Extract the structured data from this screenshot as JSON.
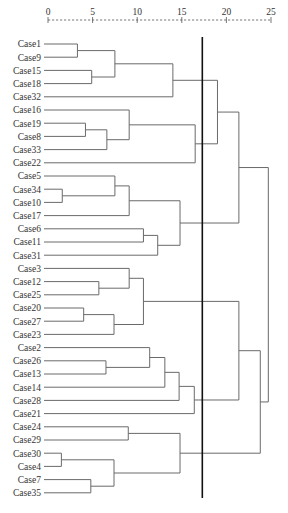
{
  "chart_data": {
    "type": "dendrogram",
    "title": "",
    "xlabel": "",
    "ylabel": "",
    "xlim": [
      0,
      25
    ],
    "ticks": [
      "0",
      "5",
      "10",
      "15",
      "20",
      "25"
    ],
    "tick_values": [
      0,
      5,
      10,
      15,
      20,
      25
    ],
    "leaves": [
      "Case1",
      "Case9",
      "Case15",
      "Case18",
      "Case32",
      "Case16",
      "Case19",
      "Case8",
      "Case33",
      "Case22",
      "Case5",
      "Case34",
      "Case10",
      "Case17",
      "Case6",
      "Case11",
      "Case31",
      "Case3",
      "Case12",
      "Case25",
      "Case20",
      "Case27",
      "Case23",
      "Case2",
      "Case26",
      "Case13",
      "Case14",
      "Case28",
      "Case21",
      "Case24",
      "Case29",
      "Case30",
      "Case4",
      "Case7",
      "Case35"
    ],
    "merges": [
      {
        "id": "m1",
        "left": "Case1",
        "right": "Case9",
        "height": 3.3
      },
      {
        "id": "m2",
        "left": "Case15",
        "right": "Case18",
        "height": 4.9
      },
      {
        "id": "m3",
        "left": "m1",
        "right": "m2",
        "height": 7.5
      },
      {
        "id": "m4",
        "left": "m3",
        "right": "Case32",
        "height": 14.0
      },
      {
        "id": "m5",
        "left": "Case19",
        "right": "Case8",
        "height": 4.2
      },
      {
        "id": "m6",
        "left": "m5",
        "right": "Case33",
        "height": 6.6
      },
      {
        "id": "m7",
        "left": "Case16",
        "right": "m6",
        "height": 9.1
      },
      {
        "id": "m8",
        "left": "m7",
        "right": "Case22",
        "height": 16.5
      },
      {
        "id": "m9",
        "left": "m4",
        "right": "m8",
        "height": 19.0
      },
      {
        "id": "m10",
        "left": "Case34",
        "right": "Case10",
        "height": 1.6
      },
      {
        "id": "m11",
        "left": "Case5",
        "right": "m10",
        "height": 7.5
      },
      {
        "id": "m12",
        "left": "m11",
        "right": "Case17",
        "height": 9.1
      },
      {
        "id": "m13",
        "left": "Case6",
        "right": "Case11",
        "height": 10.7
      },
      {
        "id": "m14",
        "left": "m13",
        "right": "Case31",
        "height": 12.3
      },
      {
        "id": "m15",
        "left": "m12",
        "right": "m14",
        "height": 14.8
      },
      {
        "id": "m16",
        "left": "m9",
        "right": "m15",
        "height": 21.4
      },
      {
        "id": "m17",
        "left": "Case12",
        "right": "Case25",
        "height": 5.7
      },
      {
        "id": "m18",
        "left": "Case3",
        "right": "m17",
        "height": 9.1
      },
      {
        "id": "m19",
        "left": "Case20",
        "right": "Case27",
        "height": 4.0
      },
      {
        "id": "m20",
        "left": "m19",
        "right": "Case23",
        "height": 7.4
      },
      {
        "id": "m21",
        "left": "m18",
        "right": "m20",
        "height": 10.7
      },
      {
        "id": "m22",
        "left": "Case26",
        "right": "Case13",
        "height": 6.5
      },
      {
        "id": "m23",
        "left": "Case2",
        "right": "m22",
        "height": 11.4
      },
      {
        "id": "m24",
        "left": "m23",
        "right": "Case14",
        "height": 13.1
      },
      {
        "id": "m25",
        "left": "m24",
        "right": "Case28",
        "height": 14.7
      },
      {
        "id": "m26",
        "left": "m25",
        "right": "Case21",
        "height": 16.4
      },
      {
        "id": "m27",
        "left": "m21",
        "right": "m26",
        "height": 21.4
      },
      {
        "id": "m28",
        "left": "Case24",
        "right": "Case29",
        "height": 9.0
      },
      {
        "id": "m29",
        "left": "Case30",
        "right": "Case4",
        "height": 1.5
      },
      {
        "id": "m30",
        "left": "Case7",
        "right": "Case35",
        "height": 4.8
      },
      {
        "id": "m31",
        "left": "m29",
        "right": "m30",
        "height": 7.4
      },
      {
        "id": "m32",
        "left": "m28",
        "right": "m31",
        "height": 14.8
      },
      {
        "id": "m33",
        "left": "m27",
        "right": "m32",
        "height": 23.8
      },
      {
        "id": "m34",
        "left": "m16",
        "right": "m33",
        "height": 24.7
      }
    ],
    "cut_line": 17.3,
    "grid": false,
    "legend": "none"
  }
}
